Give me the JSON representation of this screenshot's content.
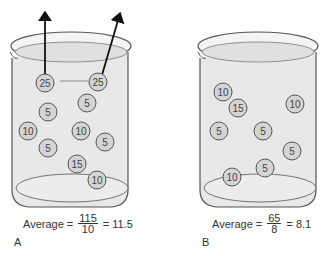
{
  "panels": [
    {
      "label": "A",
      "average_label": "Average",
      "numerator": "115",
      "denominator": "10",
      "result": "11.5",
      "balls": [
        {
          "value": "25",
          "escaping": true
        },
        {
          "value": "25",
          "escaping": true
        },
        {
          "value": "5"
        },
        {
          "value": "5"
        },
        {
          "value": "10"
        },
        {
          "value": "10"
        },
        {
          "value": "5"
        },
        {
          "value": "5"
        },
        {
          "value": "15"
        },
        {
          "value": "10"
        }
      ]
    },
    {
      "label": "B",
      "average_label": "Average",
      "numerator": "65",
      "denominator": "8",
      "result": "8.1",
      "balls": [
        {
          "value": "10"
        },
        {
          "value": "15"
        },
        {
          "value": "10"
        },
        {
          "value": "5"
        },
        {
          "value": "5"
        },
        {
          "value": "5"
        },
        {
          "value": "5"
        },
        {
          "value": "10"
        }
      ]
    }
  ],
  "colors": {
    "liquid": "#e6e6e6",
    "glass_outline": "#555555",
    "ball_fill": "#d4d4d4",
    "arrow": "#111111"
  },
  "symbols": {
    "equals": "="
  }
}
